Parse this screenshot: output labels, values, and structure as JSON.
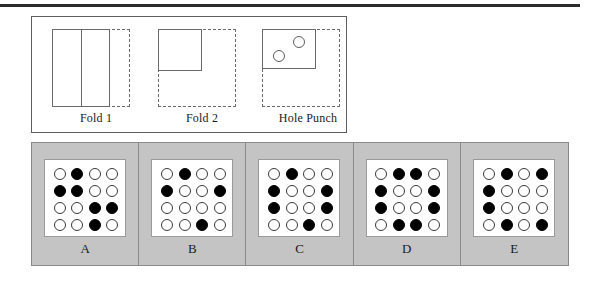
{
  "top_rule": {
    "color": "#2b2b2b"
  },
  "colors": {
    "panel_background": "#c4c4c4",
    "card_background": "#ffffff",
    "outline": "#5d5d5d",
    "dashed_outline": "#6a6a6a",
    "hole_filled": "#000000",
    "hole_open": "#ffffff"
  },
  "fold_panel": {
    "stages": [
      {
        "caption": "Fold 1",
        "solid_shape": "vertical-rectangle-left",
        "crease": "vertical-center-line",
        "phantom_shape": "dashed-rectangle-right"
      },
      {
        "caption": "Fold 2",
        "solid_shape": "square-upper-left-quadrant",
        "crease": "none",
        "phantom_shape": "dashed-square-full"
      },
      {
        "caption": "Hole Punch",
        "solid_shape": "rectangle-upper-left",
        "crease": "none",
        "phantom_shape": "dashed-square-full",
        "holes": [
          {
            "name": "hole-upper-right",
            "x_pct": 62,
            "y_pct": 22
          },
          {
            "name": "hole-lower-left",
            "x_pct": 24,
            "y_pct": 52
          }
        ]
      }
    ]
  },
  "options": [
    {
      "label": "A",
      "grid": [
        [
          0,
          1,
          0,
          0
        ],
        [
          1,
          1,
          0,
          0
        ],
        [
          0,
          0,
          1,
          1
        ],
        [
          0,
          0,
          1,
          0
        ]
      ]
    },
    {
      "label": "B",
      "grid": [
        [
          0,
          1,
          0,
          0
        ],
        [
          1,
          0,
          0,
          1
        ],
        [
          0,
          0,
          0,
          0
        ],
        [
          0,
          0,
          1,
          0
        ]
      ]
    },
    {
      "label": "C",
      "grid": [
        [
          0,
          1,
          0,
          0
        ],
        [
          1,
          0,
          0,
          1
        ],
        [
          1,
          0,
          0,
          1
        ],
        [
          0,
          0,
          1,
          0
        ]
      ]
    },
    {
      "label": "D",
      "grid": [
        [
          0,
          1,
          1,
          0
        ],
        [
          1,
          0,
          0,
          1
        ],
        [
          1,
          0,
          0,
          1
        ],
        [
          0,
          1,
          1,
          0
        ]
      ]
    },
    {
      "label": "E",
      "grid": [
        [
          0,
          1,
          0,
          1
        ],
        [
          1,
          0,
          0,
          0
        ],
        [
          1,
          0,
          0,
          0
        ],
        [
          0,
          1,
          0,
          1
        ]
      ]
    }
  ]
}
